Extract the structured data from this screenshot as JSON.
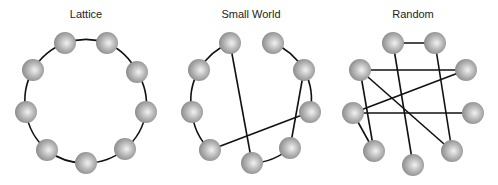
{
  "figure": {
    "panels": [
      {
        "id": "lattice",
        "title": "Lattice",
        "nodes": [
          "top-left",
          "top-right",
          "upper-left",
          "upper-right",
          "left",
          "right",
          "lower-left",
          "lower-right",
          "bottom"
        ],
        "edges": [
          {
            "from": "top-left",
            "to": "top-right",
            "style": "arc"
          },
          {
            "from": "top-right",
            "to": "upper-right",
            "style": "arc"
          },
          {
            "from": "upper-right",
            "to": "right",
            "style": "arc"
          },
          {
            "from": "right",
            "to": "lower-right",
            "style": "arc"
          },
          {
            "from": "lower-right",
            "to": "bottom",
            "style": "arc"
          },
          {
            "from": "bottom",
            "to": "lower-left",
            "style": "arc"
          },
          {
            "from": "lower-left",
            "to": "left",
            "style": "arc"
          },
          {
            "from": "left",
            "to": "upper-left",
            "style": "arc"
          },
          {
            "from": "upper-left",
            "to": "top-left",
            "style": "arc"
          }
        ]
      },
      {
        "id": "small-world",
        "title": "Small World",
        "nodes": [
          "top-left",
          "top-right",
          "upper-left",
          "upper-right",
          "left",
          "right",
          "lower-left",
          "lower-right",
          "bottom"
        ],
        "edges": [
          {
            "from": "top-left",
            "to": "upper-left",
            "style": "arc"
          },
          {
            "from": "upper-left",
            "to": "left",
            "style": "arc"
          },
          {
            "from": "left",
            "to": "lower-left",
            "style": "arc"
          },
          {
            "from": "lower-left",
            "to": "right",
            "style": "line"
          },
          {
            "from": "top-left",
            "to": "bottom",
            "style": "line"
          },
          {
            "from": "bottom",
            "to": "lower-right",
            "style": "arc"
          },
          {
            "from": "lower-right",
            "to": "upper-right",
            "style": "line"
          },
          {
            "from": "top-right",
            "to": "upper-right",
            "style": "arc"
          },
          {
            "from": "upper-right",
            "to": "right",
            "style": "arc"
          }
        ]
      },
      {
        "id": "random",
        "title": "Random",
        "nodes": [
          "top-left",
          "top-right",
          "upper-left",
          "upper-right",
          "left",
          "right",
          "lower-left",
          "lower-right",
          "bottom"
        ],
        "edges": [
          {
            "from": "top-left",
            "to": "top-right",
            "style": "line"
          },
          {
            "from": "top-left",
            "to": "bottom",
            "style": "line"
          },
          {
            "from": "top-right",
            "to": "lower-right",
            "style": "line"
          },
          {
            "from": "upper-left",
            "to": "upper-right",
            "style": "line"
          },
          {
            "from": "upper-left",
            "to": "lower-right",
            "style": "line"
          },
          {
            "from": "upper-left",
            "to": "lower-left",
            "style": "line"
          },
          {
            "from": "upper-right",
            "to": "left",
            "style": "line"
          },
          {
            "from": "left",
            "to": "right",
            "style": "line"
          },
          {
            "from": "left",
            "to": "lower-left",
            "style": "line"
          }
        ]
      }
    ],
    "colors": {
      "edge": "#111111",
      "node_light": "#f2f2f2",
      "node_mid": "#b4b4b4",
      "node_dark": "#8a8a8a",
      "title": "#222222"
    }
  }
}
